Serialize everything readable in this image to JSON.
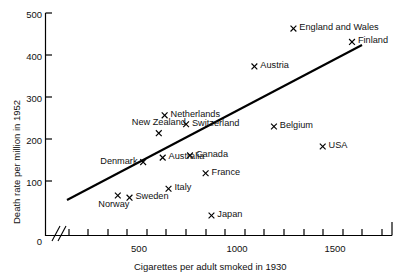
{
  "chart_data": {
    "type": "scatter",
    "title": "",
    "xlabel": "Cigarettes per adult smoked in 1930",
    "ylabel": "Death rate per million in 1952",
    "xlim": [
      0,
      1700
    ],
    "ylim": [
      0,
      500
    ],
    "x_axis_break": true,
    "grid": false,
    "legend": "none",
    "x_ticklabels": [
      "0",
      "500",
      "1000",
      "1500"
    ],
    "x_tickvalues": [
      0,
      500,
      1000,
      1500
    ],
    "x_minor_tick_interval": 100,
    "y_ticklabels": [
      "0",
      "100",
      "200",
      "300",
      "400",
      "500"
    ],
    "y_tickvalues": [
      0,
      100,
      200,
      300,
      400,
      500
    ],
    "marker": "x",
    "points": [
      {
        "label": "Norway",
        "x": 250,
        "y": 90,
        "label_pos": "below-left"
      },
      {
        "label": "Sweden",
        "x": 310,
        "y": 85,
        "label_pos": "right"
      },
      {
        "label": "Denmark",
        "x": 380,
        "y": 165,
        "label_pos": "left"
      },
      {
        "label": "Australia",
        "x": 480,
        "y": 175,
        "label_pos": "right"
      },
      {
        "label": "New Zealand",
        "x": 460,
        "y": 230,
        "label_pos": "above"
      },
      {
        "label": "Netherlands",
        "x": 490,
        "y": 270,
        "label_pos": "right"
      },
      {
        "label": "Italy",
        "x": 510,
        "y": 105,
        "label_pos": "right"
      },
      {
        "label": "Switzerland",
        "x": 600,
        "y": 250,
        "label_pos": "right"
      },
      {
        "label": "Canada",
        "x": 620,
        "y": 180,
        "label_pos": "right"
      },
      {
        "label": "France",
        "x": 700,
        "y": 140,
        "label_pos": "right"
      },
      {
        "label": "Japan",
        "x": 730,
        "y": 45,
        "label_pos": "right"
      },
      {
        "label": "Austria",
        "x": 950,
        "y": 380,
        "label_pos": "right"
      },
      {
        "label": "Belgium",
        "x": 1050,
        "y": 245,
        "label_pos": "right"
      },
      {
        "label": "USA",
        "x": 1300,
        "y": 200,
        "label_pos": "right"
      },
      {
        "label": "England and Wales",
        "x": 1150,
        "y": 465,
        "label_pos": "right"
      },
      {
        "label": "Finland",
        "x": 1450,
        "y": 435,
        "label_pos": "right"
      }
    ],
    "trend_line": {
      "type": "line",
      "x_start": 210,
      "y_start": 95,
      "x_end": 1440,
      "y_end": 425
    },
    "colors": {
      "axis": "#000000",
      "marker": "#000000",
      "line": "#000000",
      "background": "#ffffff",
      "text": "#111111"
    }
  }
}
